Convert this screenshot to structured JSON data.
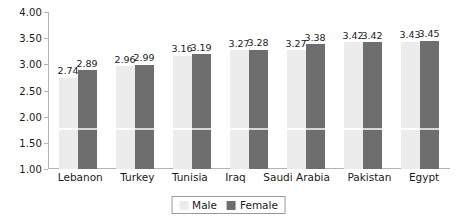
{
  "chart_data": {
    "type": "bar",
    "title": "",
    "subtitle": "",
    "xlabel": "",
    "ylabel": "",
    "categories": [
      "Lebanon",
      "Turkey",
      "Tunisia",
      "Iraq",
      "Saudi Arabia",
      "Pakistan",
      "Egypt"
    ],
    "series": [
      {
        "name": "Male",
        "color": "#ececec",
        "values": [
          2.74,
          2.96,
          3.16,
          3.27,
          3.27,
          3.42,
          3.43
        ],
        "labels": [
          "2.74",
          "2.96",
          "3.16",
          "3.27",
          "3.27",
          "3.42",
          "3.43"
        ]
      },
      {
        "name": "Female",
        "color": "#6e6e6e",
        "values": [
          2.89,
          2.99,
          3.19,
          3.28,
          3.38,
          3.42,
          3.45
        ],
        "labels": [
          "2.89",
          "2.99",
          "3.19",
          "3.28",
          "3.38",
          "3.42",
          "3.45"
        ]
      }
    ],
    "ylim": [
      1.0,
      4.0
    ],
    "ytick_values": [
      4.0,
      3.5,
      3.0,
      2.5,
      2.0,
      1.5,
      1.0
    ],
    "ytick_labels": [
      "4.00",
      "3.50",
      "3.00",
      "2.50",
      "2.00",
      "1.50",
      "1.00"
    ],
    "grid": false,
    "inner_gridline_value": 1.75,
    "legend_position": "bottom",
    "legend": [
      "Male",
      "Female"
    ],
    "axis_color": "#b4b4b4",
    "text_color": "#1a1a1a",
    "background": "#ffffff"
  }
}
